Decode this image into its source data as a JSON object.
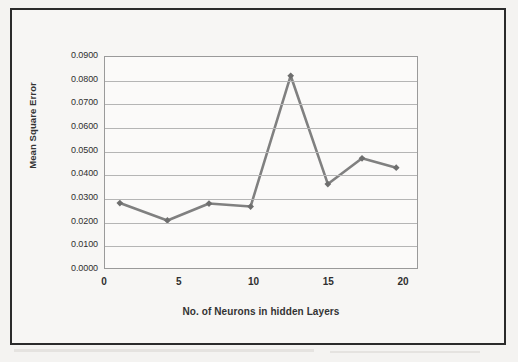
{
  "figure": {
    "background_color": "#f4f3f1",
    "frame_color": "#2b2b2b",
    "plot_background": "#fbfaf9"
  },
  "chart_data": {
    "type": "line",
    "title": "",
    "subtitle": "",
    "xlabel": "No. of Neurons in hidden Layers",
    "ylabel": "Mean Square Error",
    "xlim": [
      0,
      21
    ],
    "ylim": [
      0.0,
      0.09
    ],
    "xticks": [
      0,
      5,
      10,
      15,
      20
    ],
    "xtick_labels": [
      "0",
      "5",
      "10",
      "15",
      "20"
    ],
    "yticks": [
      0.0,
      0.01,
      0.02,
      0.03,
      0.04,
      0.05,
      0.06,
      0.07,
      0.08,
      0.09
    ],
    "ytick_labels": [
      "0.0000",
      "0.0100",
      "0.0200",
      "0.0300",
      "0.0400",
      "0.0500",
      "0.0600",
      "0.0700",
      "0.0800",
      "0.0900"
    ],
    "grid": "horizontal",
    "legend": "none",
    "series": [
      {
        "name": "Mean Square Error",
        "line_color": "#808080",
        "marker": "diamond",
        "marker_color": "#6e6e6e",
        "x": [
          1.0,
          4.2,
          7.0,
          9.8,
          12.5,
          15.0,
          17.3,
          19.6
        ],
        "y": [
          0.0277,
          0.0203,
          0.0275,
          0.0262,
          0.082,
          0.0358,
          0.0468,
          0.0428
        ]
      }
    ],
    "annotations": []
  }
}
